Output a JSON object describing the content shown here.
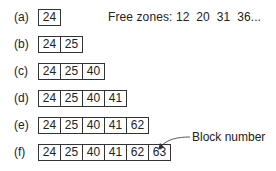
{
  "free_zones": {
    "label": "Free zones:",
    "values": "12  20  31  36..."
  },
  "rows": [
    {
      "label": "(a)",
      "cells": [
        "24"
      ]
    },
    {
      "label": "(b)",
      "cells": [
        "24",
        "25"
      ]
    },
    {
      "label": "(c)",
      "cells": [
        "24",
        "25",
        "40"
      ]
    },
    {
      "label": "(d)",
      "cells": [
        "24",
        "25",
        "40",
        "41"
      ]
    },
    {
      "label": "(e)",
      "cells": [
        "24",
        "25",
        "40",
        "41",
        "62"
      ]
    },
    {
      "label": "(f)",
      "cells": [
        "24",
        "25",
        "40",
        "41",
        "62",
        "63"
      ]
    }
  ],
  "callout": {
    "text": "Block number"
  }
}
